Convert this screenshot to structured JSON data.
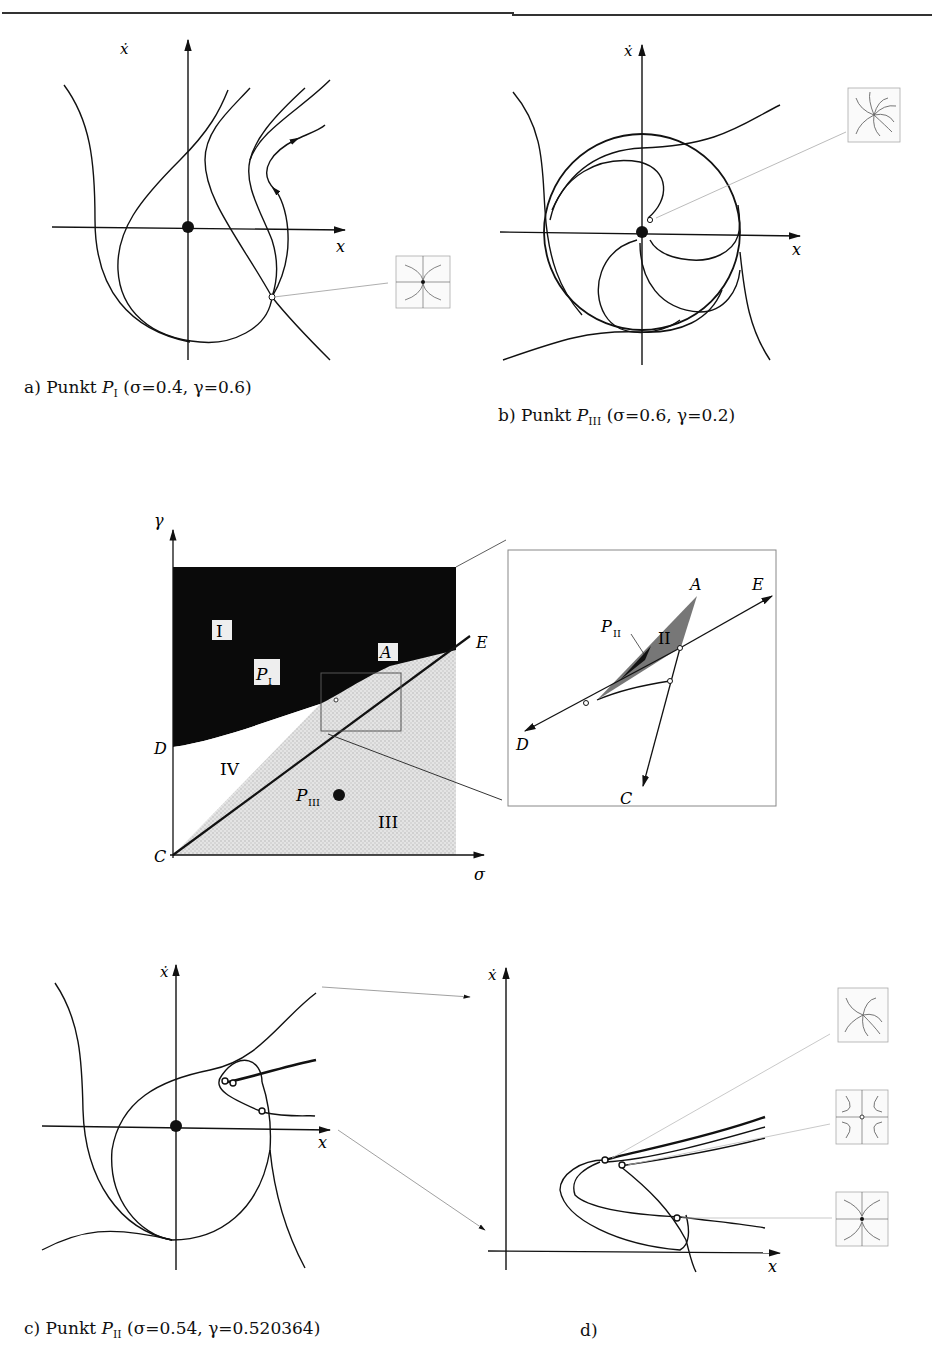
{
  "header": {
    "running_head": "p  p"
  },
  "panels": {
    "a": {
      "axis_x": "x",
      "axis_y": "ẋ",
      "caption_prefix": "a) Punkt ",
      "point": "P",
      "point_sub": "I",
      "params": "(σ=0.4,  γ=0.6)",
      "inset": "saddle-node-icon"
    },
    "b": {
      "axis_x": "x",
      "axis_y": "ẋ",
      "caption_prefix": "b) Punkt ",
      "point": "P",
      "point_sub": "III",
      "params": "(σ=0.6,  γ=0.2)",
      "inset": "spiral-focus-icon"
    },
    "c": {
      "axis_x": "x",
      "axis_y": "ẋ",
      "caption_prefix": "c) Punkt ",
      "point": "P",
      "point_sub": "II",
      "params": "(σ=0.54,  γ=0.520364)"
    },
    "d": {
      "axis_x": "x",
      "axis_y": "ẋ",
      "caption": "d)",
      "insets": [
        "spiral-focus-icon",
        "saddle-icon",
        "node-icon"
      ]
    }
  },
  "bifurcation_diagram": {
    "axis_x": "σ",
    "axis_y": "γ",
    "regions": [
      "I",
      "II",
      "III",
      "IV"
    ],
    "points": {
      "A": "A",
      "C": "C",
      "D": "D",
      "E": "E"
    },
    "markers": {
      "p1": "P",
      "p1_sub": "I",
      "p3": "P",
      "p3_sub": "III",
      "p2": "P",
      "p2_sub": "II"
    }
  }
}
